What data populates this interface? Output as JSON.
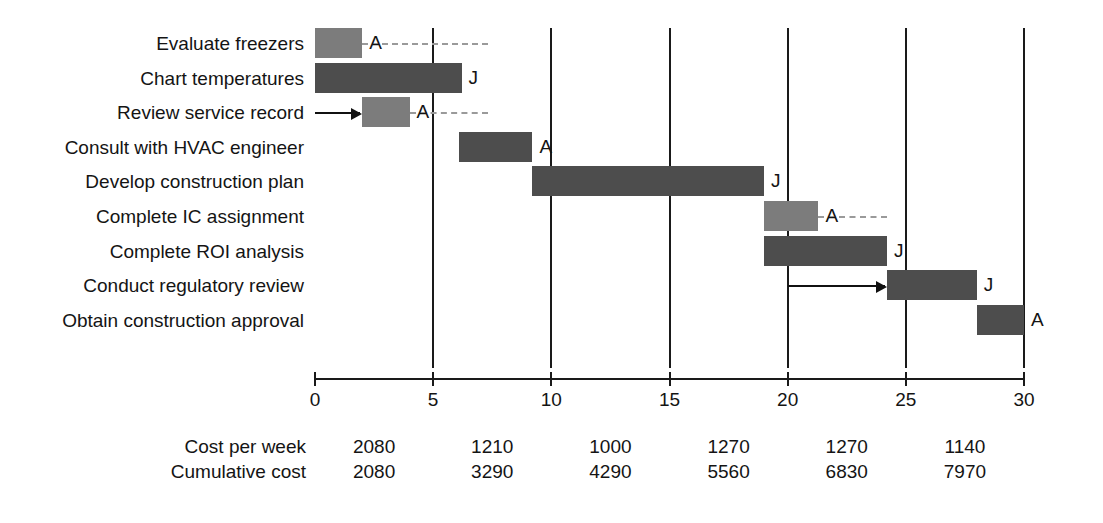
{
  "chart_data": {
    "type": "bar",
    "title": "",
    "xlabel": "",
    "ylabel": "",
    "xlim": [
      0,
      30
    ],
    "xticks": [
      0,
      5,
      10,
      15,
      20,
      25,
      30
    ],
    "xticklabels": [
      "0",
      "5",
      "10",
      "15",
      "20",
      "25",
      "30"
    ],
    "grid": true,
    "legend_position": "none",
    "categories": [
      "Evaluate freezers",
      "Chart temperatures",
      "Review service record",
      "Consult with HVAC engineer",
      "Develop construction plan",
      "Complete IC assignment",
      "Complete ROI analysis",
      "Conduct regulatory review",
      "Obtain construction approval"
    ],
    "tasks": [
      {
        "label": "Evaluate freezers",
        "start": 0,
        "end": 2,
        "shade": "light",
        "tag": "A",
        "slack_end": 7.3
      },
      {
        "label": "Chart temperatures",
        "start": 0,
        "end": 6.2,
        "shade": "dark",
        "tag": "J",
        "slack_end": null
      },
      {
        "label": "Review service record",
        "start": 2,
        "end": 4,
        "shade": "light",
        "tag": "A",
        "slack_end": 7.3
      },
      {
        "label": "Consult with HVAC engineer",
        "start": 6.1,
        "end": 9.2,
        "shade": "dark",
        "tag": "A",
        "slack_end": null
      },
      {
        "label": "Develop construction plan",
        "start": 9.2,
        "end": 19,
        "shade": "dark",
        "tag": "J",
        "slack_end": null
      },
      {
        "label": "Complete IC assignment",
        "start": 19,
        "end": 21.3,
        "shade": "light",
        "tag": "A",
        "slack_end": 24.2
      },
      {
        "label": "Complete ROI analysis",
        "start": 19,
        "end": 24.2,
        "shade": "dark",
        "tag": "J",
        "slack_end": null
      },
      {
        "label": "Conduct regulatory review",
        "start": 24.2,
        "end": 28,
        "shade": "dark",
        "tag": "J",
        "slack_end": null
      },
      {
        "label": "Obtain construction approval",
        "start": 28,
        "end": 30,
        "shade": "dark",
        "tag": "A",
        "slack_end": null
      }
    ],
    "dependencies": [
      {
        "from_week": 0,
        "to_week": 2,
        "row": 2
      },
      {
        "from_week": 20,
        "to_week": 24.2,
        "row": 7
      }
    ],
    "cost_periods": [
      {
        "center_week": 2.5,
        "cost_per_week": "2080",
        "cumulative_cost": "2080"
      },
      {
        "center_week": 7.5,
        "cost_per_week": "1210",
        "cumulative_cost": "3290"
      },
      {
        "center_week": 12.5,
        "cost_per_week": "1000",
        "cumulative_cost": "4290"
      },
      {
        "center_week": 17.5,
        "cost_per_week": "1270",
        "cumulative_cost": "5560"
      },
      {
        "center_week": 22.5,
        "cost_per_week": "1270",
        "cumulative_cost": "6830"
      },
      {
        "center_week": 27.5,
        "cost_per_week": "1140",
        "cumulative_cost": "7970"
      }
    ],
    "cost_row_labels": {
      "cost_per_week": "Cost per week",
      "cumulative_cost": "Cumulative cost"
    },
    "colors": {
      "bar_dark": "#4d4d4d",
      "bar_light": "#7c7c7c",
      "gridline": "#1a1a1a",
      "slack_dash": "#9a9a9a",
      "text": "#141414",
      "background": "#ffffff"
    }
  }
}
